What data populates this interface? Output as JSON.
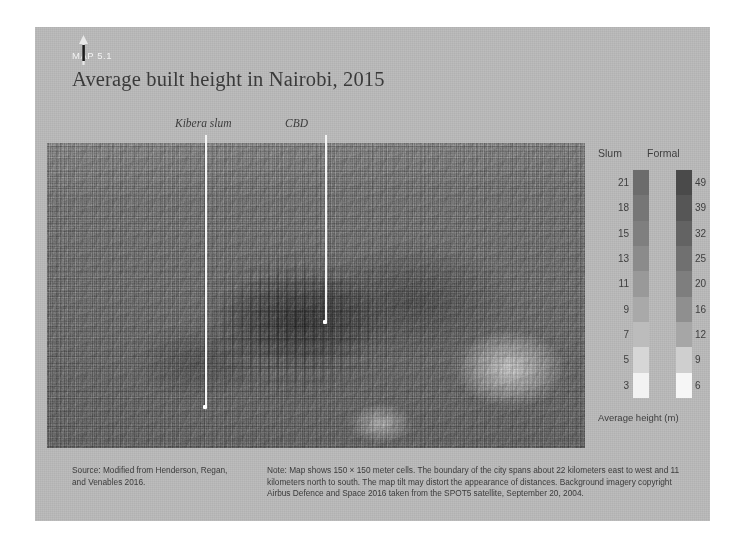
{
  "figure": {
    "map_number": "MAP 5.1",
    "title": "Average built height in Nairobi, 2015"
  },
  "map": {
    "north_arrow_icon": "north-arrow-icon",
    "callouts": [
      {
        "label": "Kibera slum",
        "icon": "leader-line-icon"
      },
      {
        "label": "CBD",
        "icon": "leader-line-icon"
      }
    ]
  },
  "legend": {
    "headers": {
      "slum": "Slum",
      "formal": "Formal"
    },
    "axis_caption": "Average height (m)",
    "slum_ticks": [
      "21",
      "18",
      "15",
      "13",
      "11",
      "9",
      "7",
      "5",
      "3"
    ],
    "formal_ticks": [
      "49",
      "39",
      "32",
      "25",
      "20",
      "16",
      "12",
      "9",
      "6"
    ],
    "slum_colors": [
      "#6c6c6c",
      "#767676",
      "#7f7f7f",
      "#8b8b8b",
      "#999999",
      "#a9a9a9",
      "#bcbcbc",
      "#d6d6d6",
      "#f2f2f2"
    ],
    "formal_colors": [
      "#4a4a4a",
      "#565656",
      "#636363",
      "#707070",
      "#7e7e7e",
      "#8f8f8f",
      "#a6a6a6",
      "#cfcfcf",
      "#f6f6f6"
    ]
  },
  "footnotes": {
    "source": "Source: Modified from Henderson, Regan, and Venables 2016.",
    "note": "Note: Map shows 150 × 150 meter cells. The boundary of the city spans about 22 kilometers east to west and 11 kilometers north to south. The map tilt may distort the appearance of distances. Background imagery copyright Airbus Defence and Space 2016 taken from the SPOT5 satellite, September 20, 2004."
  },
  "chart_data": {
    "type": "map",
    "title": "Average built height in Nairobi, 2015",
    "subtitle": "MAP 5.1",
    "legend_title": "Average height (m)",
    "series": [
      {
        "name": "Slum",
        "values": [
          3,
          5,
          7,
          9,
          11,
          13,
          15,
          18,
          21
        ],
        "unit": "m"
      },
      {
        "name": "Formal",
        "values": [
          6,
          9,
          12,
          16,
          20,
          25,
          32,
          39,
          49
        ],
        "unit": "m"
      }
    ],
    "annotations": [
      "Kibera slum",
      "CBD"
    ],
    "cell_size_m": 150,
    "extent_east_west_km": 22,
    "extent_north_south_km": 11
  }
}
